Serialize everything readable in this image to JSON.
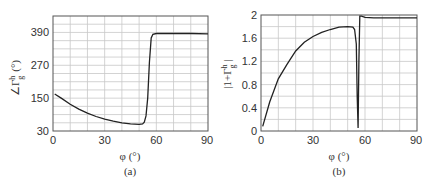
{
  "chart_data": [
    {
      "type": "line",
      "panel": "(a)",
      "title": "",
      "xlabel": "φ (°)",
      "ylabel": "∠Γ_g^h (°)",
      "xlim": [
        0,
        90
      ],
      "ylim": [
        30,
        450
      ],
      "xticks": [
        0,
        30,
        60,
        90
      ],
      "yticks": [
        30,
        150,
        270,
        390
      ],
      "grid": true,
      "x": [
        1,
        5,
        10,
        15,
        20,
        25,
        30,
        35,
        40,
        45,
        50,
        52,
        53,
        54,
        55,
        56,
        57,
        58,
        60,
        65,
        70,
        80,
        90
      ],
      "series": [
        {
          "name": "phase",
          "values": [
            165,
            149,
            128,
            110,
            95,
            83,
            73,
            66,
            60,
            56,
            54,
            56,
            62,
            85,
            150,
            280,
            370,
            383,
            386,
            386,
            386,
            386,
            385
          ]
        }
      ]
    },
    {
      "type": "line",
      "panel": "(b)",
      "title": "",
      "xlabel": "φ (°)",
      "ylabel": "|1+Γ_g^h|",
      "xlim": [
        0,
        90
      ],
      "ylim": [
        0,
        2
      ],
      "xticks": [
        0,
        30,
        60,
        90
      ],
      "yticks": [
        0,
        0.4,
        0.8,
        1.2,
        1.6,
        2
      ],
      "grid": true,
      "x": [
        1,
        5,
        10,
        15,
        20,
        25,
        30,
        35,
        40,
        45,
        50,
        53,
        54,
        55,
        55.5,
        56,
        56.5,
        57,
        58,
        60,
        65,
        70,
        80,
        90
      ],
      "series": [
        {
          "name": "magnitude",
          "values": [
            0.08,
            0.5,
            0.9,
            1.15,
            1.38,
            1.53,
            1.63,
            1.7,
            1.75,
            1.79,
            1.8,
            1.79,
            1.75,
            1.5,
            0.6,
            0.05,
            1.2,
            1.98,
            1.98,
            1.96,
            1.95,
            1.95,
            1.95,
            1.95
          ]
        }
      ]
    }
  ],
  "panels": {
    "a": {
      "caption": "(a)",
      "xlabel": "φ (°)",
      "ylabel_main": "∠Γ",
      "ylabel_sup": "h",
      "ylabel_sub": "g",
      "ylabel_unit": "(°)",
      "xticks": [
        "0",
        "30",
        "60",
        "90"
      ],
      "yticks": [
        "30",
        "150",
        "270",
        "390"
      ]
    },
    "b": {
      "caption": "(b)",
      "xlabel": "φ (°)",
      "ylabel_main": "|1+Γ",
      "ylabel_sup": "h",
      "ylabel_sub": "g",
      "ylabel_end": "|",
      "xticks": [
        "0",
        "30",
        "60",
        "90"
      ],
      "yticks": [
        "0",
        "0.4",
        "0.8",
        "1.2",
        "1.6",
        "2"
      ]
    }
  }
}
